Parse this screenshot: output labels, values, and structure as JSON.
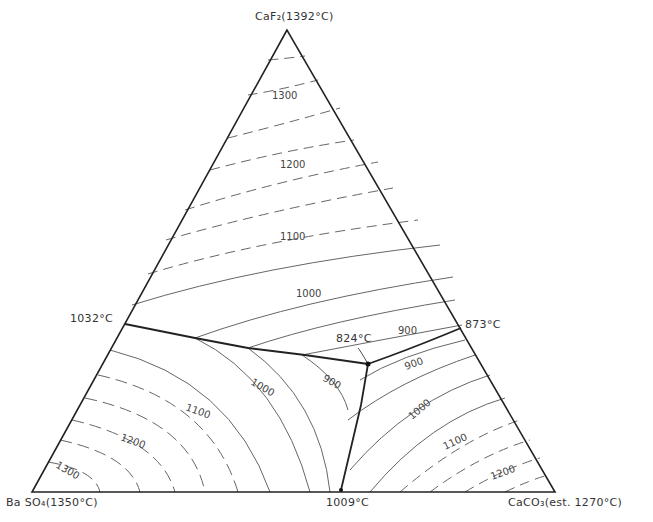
{
  "diagram": {
    "type": "ternary-phase-diagram",
    "vertices": {
      "top": {
        "compound": "CaF2",
        "label": "CaF₂(1392°C)"
      },
      "left": {
        "compound": "BaSO4",
        "label": "Ba SO₄(1350°C)"
      },
      "right": {
        "compound": "CaCO3",
        "label": "CaCO₃(est. 1270°C)"
      }
    },
    "binary_eutectics": {
      "left_edge": "1032°C",
      "right_edge": "873°C",
      "bottom_edge": "1009°C"
    },
    "ternary_eutectic": "824°C",
    "isotherm_labels": {
      "top": [
        "1300",
        "1200",
        "1100",
        "1000",
        "900"
      ],
      "left": [
        "1100",
        "1200",
        "1300",
        "1000",
        "900"
      ],
      "right": [
        "900",
        "1000",
        "1100",
        "1200"
      ]
    },
    "colors": {
      "line": "#222222",
      "isotherm": "#666666",
      "background": "#ffffff"
    }
  }
}
